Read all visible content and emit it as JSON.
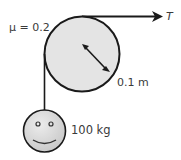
{
  "diagram": {
    "friction_label": "μ = 0.2",
    "tension_label": "T",
    "radius_label": "0.1 m",
    "mass_label": "100 kg",
    "colors": {
      "pulley_fill": "#e4e4e4",
      "mass_fill": "#dcdcdc",
      "stroke": "#1a1a1a",
      "text": "#3a3a3a"
    }
  }
}
